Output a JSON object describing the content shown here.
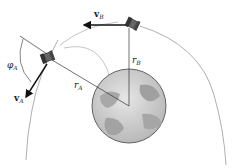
{
  "figure": {
    "labels": {
      "vA_main": "v",
      "vA_sub": "A",
      "vB_main": "v",
      "vB_sub": "B",
      "rA_main": "r",
      "rA_sub": "A",
      "rB_main": "r",
      "rB_sub": "B",
      "phiA_main": "φ",
      "phiA_sub": "A"
    },
    "elements": [
      {
        "name": "earth",
        "cx": 129,
        "cy": 106,
        "r": 37
      },
      {
        "name": "satellite-A",
        "x": 48,
        "y": 58
      },
      {
        "name": "satellite-B",
        "x": 133,
        "y": 24
      },
      {
        "name": "outer-orbit"
      },
      {
        "name": "inner-orbit"
      }
    ],
    "colors": {
      "orbit": "#9a9a9a",
      "vector": "#111111",
      "earth_fill": "#c8c8c8",
      "earth_land": "#9d9d9d",
      "earth_outline": "#555555"
    }
  }
}
